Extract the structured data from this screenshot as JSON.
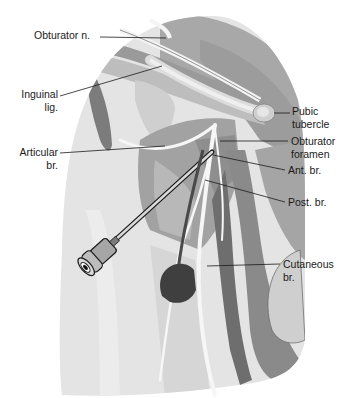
{
  "figure": {
    "type": "anatomical illustration",
    "colors": {
      "background": "#ffffff",
      "skin_light": "#e4e4e4",
      "skin_mid": "#c8c8c8",
      "muscle_dark": "#8a8a8a",
      "muscle_darker": "#6e6e6e",
      "nerve": "#f4f4f4",
      "leader_line": "#1a1a1a",
      "needle_hub": "#9a9a9a",
      "probe": "#4a4a4a"
    }
  },
  "labels": {
    "obturator_n": {
      "line1": "Obturator n."
    },
    "inguinal_lig": {
      "line1": "Inguinal",
      "line2": "lig."
    },
    "articular_br": {
      "line1": "Articular",
      "line2": "br."
    },
    "pubic_tubercle": {
      "line1": "Pubic",
      "line2": "tubercle"
    },
    "obturator_foramen": {
      "line1": "Obturator",
      "line2": "foramen"
    },
    "ant_br": {
      "line1": "Ant. br."
    },
    "post_br": {
      "line1": "Post. br."
    },
    "cutaneous_br": {
      "line1": "Cutaneous",
      "line2": "br."
    }
  }
}
